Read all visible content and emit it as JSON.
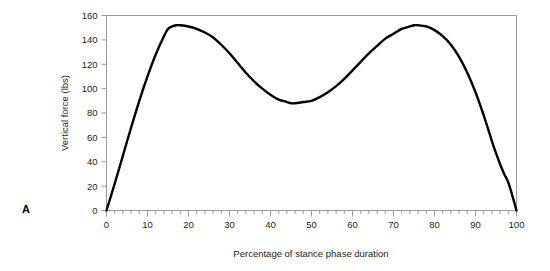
{
  "figure": {
    "panel_label": "A"
  },
  "chart_data": {
    "type": "line",
    "title": "",
    "subtitle": "",
    "xlabel": "Percentage of stance phase duration",
    "ylabel": "Vertical force (lbs)",
    "xlim": [
      0,
      100
    ],
    "ylim": [
      0,
      160
    ],
    "x_ticks": [
      0,
      10,
      20,
      30,
      40,
      50,
      60,
      70,
      80,
      90,
      100
    ],
    "x_tick_labels": [
      "0",
      "10",
      "20",
      "30",
      "40",
      "50",
      "60",
      "70",
      "80",
      "90",
      "100"
    ],
    "x_minor_tick_step": 2,
    "y_ticks": [
      0,
      20,
      40,
      60,
      80,
      100,
      120,
      140,
      160
    ],
    "y_tick_labels": [
      "0",
      "20",
      "40",
      "60",
      "80",
      "100",
      "120",
      "140",
      "160"
    ],
    "grid": false,
    "legend": null,
    "annotations": [],
    "line_color": "#000000",
    "line_width": 2.4,
    "frame_color": "#9a9a9a",
    "series": [
      {
        "name": "Vertical ground reaction force",
        "x": [
          0,
          2,
          4,
          6,
          8,
          10,
          12,
          14,
          15,
          16,
          17,
          18,
          20,
          22,
          24,
          26,
          28,
          30,
          32,
          34,
          36,
          38,
          40,
          42,
          44,
          45,
          46,
          48,
          50,
          52,
          54,
          56,
          58,
          60,
          62,
          64,
          66,
          68,
          70,
          72,
          74,
          75,
          76,
          78,
          80,
          82,
          84,
          86,
          88,
          90,
          92,
          94,
          95,
          96,
          97,
          98,
          99,
          100
        ],
        "y": [
          0,
          22,
          45,
          68,
          90,
          110,
          128,
          143,
          149,
          151,
          152,
          152,
          151,
          149,
          146,
          142,
          136,
          129,
          121,
          113,
          106,
          100,
          95,
          91,
          89,
          88,
          88,
          89,
          90,
          93,
          97,
          102,
          108,
          115,
          122,
          129,
          135,
          141,
          145,
          149,
          151,
          152,
          152,
          151,
          148,
          143,
          136,
          126,
          113,
          97,
          78,
          57,
          47,
          38,
          30,
          23,
          12,
          0
        ]
      }
    ]
  }
}
